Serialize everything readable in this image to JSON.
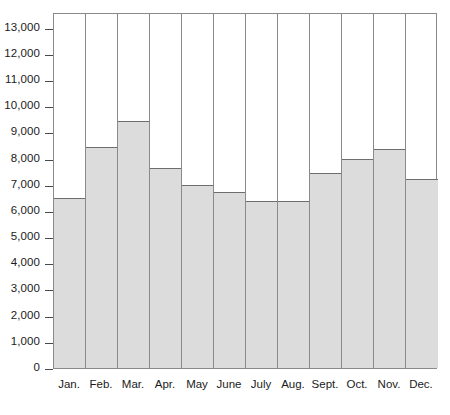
{
  "chart_data": {
    "type": "bar",
    "title": "",
    "subtitle": "",
    "xlabel": "",
    "ylabel": "",
    "categories": [
      "Jan.",
      "Feb.",
      "Mar.",
      "Apr.",
      "May",
      "June",
      "July",
      "Aug.",
      "Sept.",
      "Oct.",
      "Nov.",
      "Dec."
    ],
    "values": [
      6500,
      8450,
      9430,
      7650,
      7000,
      6720,
      6380,
      6390,
      7450,
      7980,
      8350,
      7210
    ],
    "series": [
      {
        "name": "",
        "values": [
          6500,
          8450,
          9430,
          7650,
          7000,
          6720,
          6380,
          6390,
          7450,
          7980,
          8350,
          7210
        ]
      }
    ],
    "ylim": [
      0,
      13600
    ],
    "ytick_values": [
      0,
      1000,
      2000,
      3000,
      4000,
      5000,
      6000,
      7000,
      8000,
      9000,
      10000,
      11000,
      12000,
      13000
    ],
    "ytick_labels": [
      "0",
      "1,000",
      "2,000",
      "3,000",
      "4,000",
      "5,000",
      "6,000",
      "7,000",
      "8,000",
      "9,000",
      "10,000",
      "11,000",
      "12,000",
      "13,000"
    ],
    "grid": false,
    "legend": null,
    "legend_position": "none",
    "annotations": [],
    "bar_fill_color": "#dcdcdc",
    "bar_edge_color": "#6e6e6e",
    "axis_color": "#8a8a8a",
    "text_color": "#1b1b1b",
    "background_color": "#ffffff"
  }
}
